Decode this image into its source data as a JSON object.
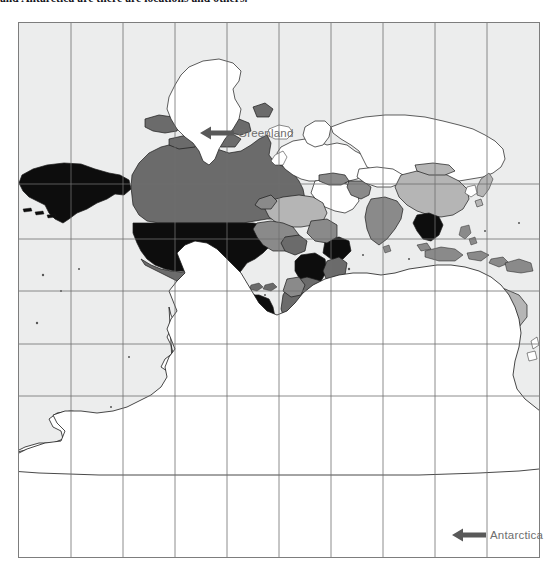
{
  "caption": {
    "text": "and Antarctica are there are locations and others."
  },
  "map": {
    "title": "world-choropleth-map",
    "frame": {
      "x": 18,
      "y": 22,
      "width": 522,
      "height": 536,
      "border_color": "#7d7d7d",
      "ocean_color": "#ffffff",
      "graticule_color": "#6f6f6f"
    },
    "graticule": {
      "vertical_lines": [
        52,
        104,
        156,
        208,
        260,
        312,
        364,
        416,
        468
      ],
      "horizontal_lines": [
        161,
        216,
        268,
        321,
        373
      ]
    },
    "legend_shades": {
      "no_data_white": "#ffffff",
      "light_gray": "#b5b5b5",
      "medium_gray": "#8a8a8a",
      "dark_gray": "#6b6b6b",
      "darkest_black": "#0d0d0d"
    },
    "country_shades": [
      {
        "name": "Greenland",
        "shade": "#ffffff"
      },
      {
        "name": "Antarctica",
        "shade": "#ffffff"
      },
      {
        "name": "Alaska",
        "shade": "#0d0d0d"
      },
      {
        "name": "United States",
        "shade": "#0d0d0d"
      },
      {
        "name": "Canada",
        "shade": "#6b6b6b"
      },
      {
        "name": "Mexico",
        "shade": "#6b6b6b"
      },
      {
        "name": "Brazil",
        "shade": "#0d0d0d"
      },
      {
        "name": "Argentina",
        "shade": "#6b6b6b"
      },
      {
        "name": "Chile",
        "shade": "#6b6b6b"
      },
      {
        "name": "Peru",
        "shade": "#6b6b6b"
      },
      {
        "name": "Colombia",
        "shade": "#8a8a8a"
      },
      {
        "name": "Europe",
        "shade": "#ffffff"
      },
      {
        "name": "Russia",
        "shade": "#ffffff"
      },
      {
        "name": "China",
        "shade": "#b5b5b5"
      },
      {
        "name": "India",
        "shade": "#8a8a8a"
      },
      {
        "name": "Australia",
        "shade": "#b5b5b5"
      },
      {
        "name": "Indonesia",
        "shade": "#8a8a8a"
      },
      {
        "name": "Vietnam",
        "shade": "#0d0d0d"
      },
      {
        "name": "Nigeria",
        "shade": "#6b6b6b"
      },
      {
        "name": "Ethiopia",
        "shade": "#0d0d0d"
      },
      {
        "name": "DR Congo",
        "shade": "#0d0d0d"
      },
      {
        "name": "South Africa",
        "shade": "#6b6b6b"
      },
      {
        "name": "Madagascar",
        "shade": "#ffffff"
      },
      {
        "name": "Saudi Arabia",
        "shade": "#ffffff"
      },
      {
        "name": "Iran",
        "shade": "#8a8a8a"
      },
      {
        "name": "Turkey",
        "shade": "#8a8a8a"
      }
    ]
  },
  "annotations": [
    {
      "id": "greenland",
      "label": "Greenland",
      "arrow_direction": "left",
      "arrow_color": "#595959",
      "text_color": "#6e6e6e",
      "x": 200,
      "y": 125
    },
    {
      "id": "antarctica",
      "label": "Antarctica",
      "arrow_direction": "left",
      "arrow_color": "#595959",
      "text_color": "#6e6e6e",
      "x": 452,
      "y": 527
    }
  ]
}
